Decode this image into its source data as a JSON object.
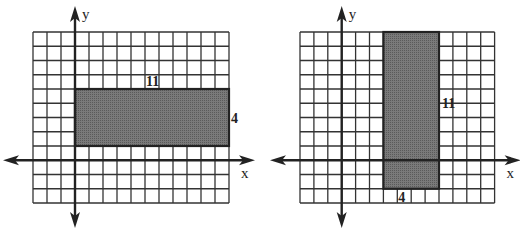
{
  "figures": [
    {
      "id": "left",
      "axis_labels": {
        "x": "x",
        "y": "y"
      },
      "grid": {
        "left": 33,
        "top": 32,
        "cols": 14,
        "rows": 12,
        "cell_w": 14.0,
        "cell_h": 14.25
      },
      "origin_col": 3,
      "origin_row": 9,
      "rectangle": {
        "col": 3,
        "row": 4,
        "w": 11,
        "h": 4
      },
      "labels": {
        "width": "11",
        "height": "4"
      }
    },
    {
      "id": "right",
      "axis_labels": {
        "x": "x",
        "y": "y"
      },
      "grid": {
        "left": 300,
        "top": 32,
        "cols": 14,
        "rows": 12,
        "cell_w": 13.9,
        "cell_h": 14.25
      },
      "origin_col": 3,
      "origin_row": 9,
      "rectangle": {
        "col": 6,
        "row": 0,
        "w": 4,
        "h": 11
      },
      "labels": {
        "width": "4",
        "height": "11"
      }
    }
  ],
  "colors": {
    "grid": "#333333",
    "fill": "#6f6f6f",
    "axis": "#222222"
  }
}
